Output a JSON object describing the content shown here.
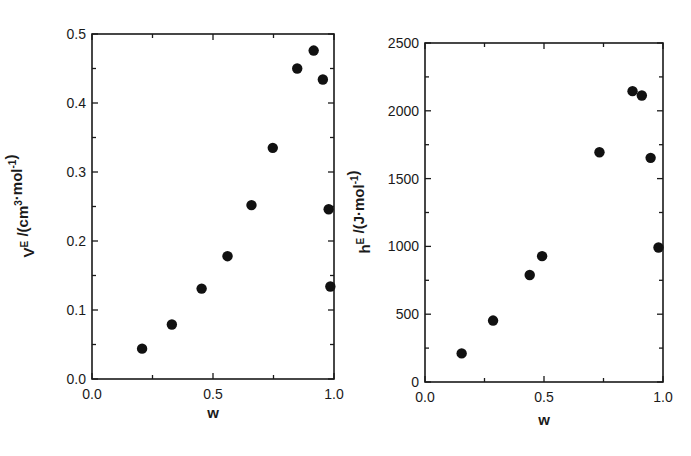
{
  "chart_data": [
    {
      "type": "scatter",
      "title": "",
      "xlabel": "w",
      "ylabel": "V^E /(cm^3·mol^-1)",
      "ylabel_parts": {
        "main": "V",
        "sup1": "E",
        "rest": " /(cm",
        "sup2": "3",
        "rest2": "·mol",
        "sup3": "-1",
        "end": ")"
      },
      "xlim": [
        0.0,
        1.0
      ],
      "ylim": [
        0.0,
        0.5
      ],
      "xticks": [
        "0.0",
        "0.5",
        "1.0"
      ],
      "yticks": [
        "0.0",
        "0.1",
        "0.2",
        "0.3",
        "0.4",
        "0.5"
      ],
      "grid": false,
      "legend": null,
      "x": [
        0.207,
        0.33,
        0.453,
        0.56,
        0.659,
        0.747,
        0.848,
        0.916,
        0.954,
        0.978,
        0.985
      ],
      "y": [
        0.044,
        0.079,
        0.131,
        0.178,
        0.252,
        0.335,
        0.45,
        0.476,
        0.434,
        0.246,
        0.134
      ]
    },
    {
      "type": "scatter",
      "title": "",
      "xlabel": "w",
      "ylabel": "h^E /(J·mol^-1)",
      "ylabel_parts": {
        "main": "h",
        "sup1": "E",
        "rest": " /(J·mol",
        "sup3": "-1",
        "end": ")"
      },
      "xlim": [
        0.0,
        1.0
      ],
      "ylim": [
        0,
        2500
      ],
      "xticks": [
        "0.0",
        "0.5",
        "1.0"
      ],
      "yticks": [
        "0",
        "500",
        "1000",
        "1500",
        "2000",
        "2500"
      ],
      "grid": false,
      "legend": null,
      "x": [
        0.154,
        0.286,
        0.44,
        0.492,
        0.733,
        0.872,
        0.911,
        0.948,
        0.981
      ],
      "y": [
        211,
        453,
        789,
        928,
        1694,
        2145,
        2113,
        1653,
        992
      ]
    }
  ],
  "style": {
    "marker_color": "#111111",
    "axis_color": "#1a1a1a",
    "background": "#ffffff"
  }
}
